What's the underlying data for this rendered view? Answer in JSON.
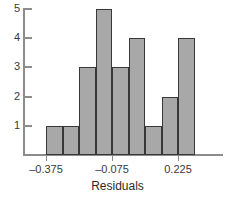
{
  "chart_data": {
    "type": "bar",
    "title": "",
    "subtitle": "",
    "xlabel": "Residuals",
    "ylabel": "",
    "grid": false,
    "legend": null,
    "bin_width": 0.075,
    "bin_edges": [
      -0.375,
      -0.3,
      -0.225,
      -0.15,
      -0.075,
      0.0,
      0.075,
      0.15,
      0.225,
      0.3
    ],
    "categories": [
      "-0.375 to -0.300",
      "-0.300 to -0.225",
      "-0.225 to -0.150",
      "-0.150 to -0.075",
      "-0.075 to 0.000",
      "0.000 to 0.075",
      "0.075 to 0.150",
      "0.150 to 0.225",
      "0.225 to 0.300"
    ],
    "values": [
      1,
      1,
      3,
      5,
      3,
      4,
      1,
      2,
      4
    ],
    "xlim": [
      -0.4875,
      0.4125
    ],
    "ylim": [
      0,
      5.35
    ],
    "xticks": [
      -0.375,
      -0.075,
      0.225
    ],
    "xtick_labels": [
      "–0.375",
      "–0.075",
      "0.225"
    ],
    "yticks": [
      1,
      2,
      3,
      4,
      5
    ],
    "ytick_labels": [
      "1",
      "2",
      "3",
      "4",
      "5"
    ],
    "total_count": 24,
    "colors": {
      "bar_fill": "#a8a8a8",
      "bar_edge": "#383838",
      "axis": "#8c8c8c",
      "text": "#2b2b2b",
      "background": "#ffffff"
    }
  },
  "axis": {
    "x_title": "Residuals"
  }
}
